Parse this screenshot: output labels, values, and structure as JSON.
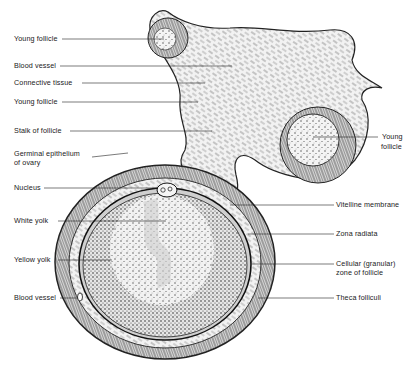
{
  "figure": {
    "colors": {
      "ink": "#1a1a1a",
      "background": "#ffffff",
      "tissue": "#d9d9d9"
    }
  },
  "labels_left": [
    {
      "id": "young-follicle-1",
      "text": "Young follicle",
      "x": 14,
      "y": 35,
      "line": [
        62,
        39,
        164,
        39
      ]
    },
    {
      "id": "blood-vessel-1",
      "text": "Blood vessel",
      "x": 14,
      "y": 63,
      "line": [
        60,
        66,
        232,
        66
      ]
    },
    {
      "id": "connective-tissue",
      "text": "Connective tissue",
      "x": 14,
      "y": 80,
      "line": [
        82,
        83,
        205,
        83
      ]
    },
    {
      "id": "young-follicle-2",
      "text": "Young follicle",
      "x": 14,
      "y": 98,
      "line": [
        62,
        102,
        198,
        102
      ]
    },
    {
      "id": "stalk-of-follicle",
      "text": "Stalk of follicle",
      "x": 14,
      "y": 127,
      "line": [
        70,
        131,
        212,
        131
      ]
    },
    {
      "id": "germinal-epithelium",
      "text": "Germinal epithelium",
      "text2": "of ovary",
      "x": 14,
      "y": 151,
      "line": [
        92,
        157,
        128,
        153
      ]
    },
    {
      "id": "nucleus",
      "text": "Nucleus",
      "x": 14,
      "y": 184,
      "line": [
        44,
        188,
        158,
        188
      ]
    },
    {
      "id": "white-yolk",
      "text": "White yolk",
      "x": 14,
      "y": 217,
      "line": [
        58,
        221,
        166,
        221
      ]
    },
    {
      "id": "yellow-yolk",
      "text": "Yellow yolk",
      "x": 14,
      "y": 256,
      "line": [
        58,
        260,
        112,
        260
      ]
    },
    {
      "id": "blood-vessel-2",
      "text": "Blood vessel",
      "x": 14,
      "y": 294,
      "line": [
        60,
        298,
        78,
        298
      ]
    }
  ],
  "labels_right": [
    {
      "id": "young-follicle-3",
      "text": "Young",
      "text2": "follicle",
      "x": 382,
      "y": 134,
      "line": [
        313,
        137,
        378,
        137
      ]
    },
    {
      "id": "vitelline-membrane",
      "text": "Vitelline membrane",
      "x": 336,
      "y": 201,
      "line": [
        230,
        205,
        334,
        205
      ]
    },
    {
      "id": "zona-radiata",
      "text": "Zona radiata",
      "x": 336,
      "y": 230,
      "line": [
        248,
        234,
        334,
        234
      ]
    },
    {
      "id": "cellular-zone",
      "text": "Cellular (granular)",
      "text2": "zone of follicle",
      "x": 336,
      "y": 261,
      "line": [
        252,
        264,
        334,
        264
      ]
    },
    {
      "id": "theca-folliculi",
      "text": "Theca folliculi",
      "x": 336,
      "y": 294,
      "line": [
        258,
        298,
        334,
        298
      ]
    }
  ]
}
